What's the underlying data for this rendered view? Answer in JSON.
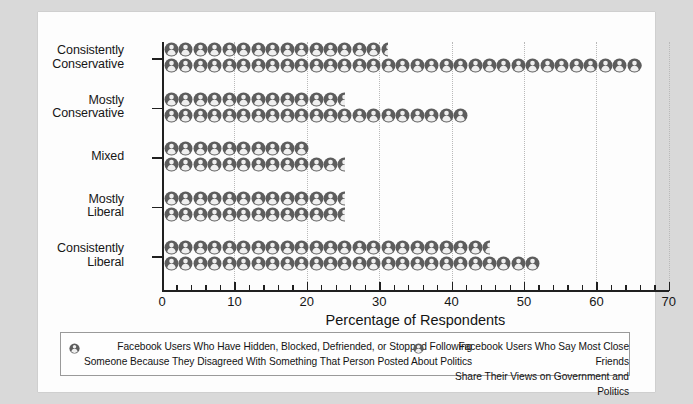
{
  "chart_data": {
    "type": "bar",
    "title": "",
    "xlabel": "Percentage of Respondents",
    "ylabel": "",
    "xlim": [
      0,
      70
    ],
    "xticks": [
      0,
      10,
      20,
      30,
      40,
      50,
      60,
      70
    ],
    "xtick_labels": [
      "0",
      "10",
      "20",
      "30",
      "40",
      "50",
      "60",
      "70"
    ],
    "grid": true,
    "legend_position": "bottom",
    "categories": [
      "Consistently Conservative",
      "Mostly Conservative",
      "Mixed",
      "Mostly Liberal",
      "Consistently Liberal"
    ],
    "series": [
      {
        "name": "Facebook Users Who Have Hidden, Blocked, Defriended, or Stopped Following Someone Because They Disagreed With Something That Person Posted About Politics",
        "values": [
          31,
          25,
          20,
          25,
          45
        ]
      },
      {
        "name": "Facebook Users Who Say Most Close Friends Share Their Views on Government and Politics",
        "values": [
          66,
          42,
          25,
          25,
          52
        ]
      }
    ]
  },
  "axis": {
    "categories": [
      {
        "line1": "Consistently",
        "line2": "Conservative"
      },
      {
        "line1": "Mostly",
        "line2": "Conservative"
      },
      {
        "line1": "Mixed",
        "line2": ""
      },
      {
        "line1": "Mostly",
        "line2": "Liberal"
      },
      {
        "line1": "Consistently",
        "line2": "Liberal"
      }
    ],
    "x_title": "Percentage of Respondents",
    "x_tick_labels": [
      "0",
      "10",
      "20",
      "30",
      "40",
      "50",
      "60",
      "70"
    ]
  },
  "legend": {
    "entries": [
      {
        "icon": "person-icon",
        "line1": "Facebook Users Who Have Hidden, Blocked, Defriended, or Stopped Following",
        "line2": "Someone Because They Disagreed With Something That Person Posted About Politics"
      },
      {
        "icon": "person-icon",
        "line1": "Facebook Users Who Say Most Close Friends",
        "line2": "Share Their Views on Government and Politics"
      }
    ]
  },
  "colors": {
    "icon_fill": "#5d5d5d",
    "icon_inner": "#efefef",
    "axis": "#202020",
    "grid": "#b9b9b9",
    "page_background": "#d9d9d9",
    "card_background": "#fdfdfd"
  }
}
